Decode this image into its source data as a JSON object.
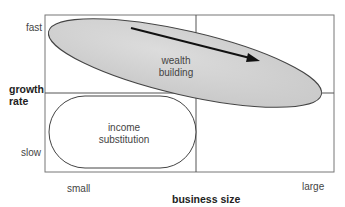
{
  "diagram": {
    "y_axis": {
      "title_line1": "growth",
      "title_line2": "rate",
      "low": "slow",
      "high": "fast"
    },
    "x_axis": {
      "title": "business size",
      "low": "small",
      "high": "large"
    },
    "regions": [
      {
        "label_line1": "wealth",
        "label_line2": "building",
        "shape": "shaded-ellipse",
        "fill": "#d4d4d4"
      },
      {
        "label_line1": "income",
        "label_line2": "substitution",
        "shape": "rounded-rectangle",
        "fill": "#ffffff"
      }
    ],
    "arrow": {
      "direction": "down-right"
    }
  }
}
